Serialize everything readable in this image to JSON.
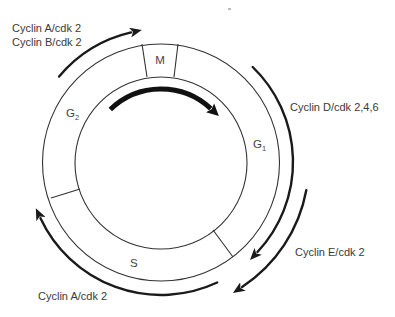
{
  "colors": {
    "background": "#ffffff",
    "ring_line": "#333333",
    "arrow": "#1a1a1a",
    "text": "#3a3a3a"
  },
  "phases": {
    "m": {
      "label": "M"
    },
    "g1": {
      "label": "G",
      "subscript": "1"
    },
    "s": {
      "label": "S"
    },
    "g2": {
      "label": "G",
      "subscript": "2"
    }
  },
  "regulators": {
    "top_left": {
      "lines": [
        "Cyclin A/cdk 2",
        "Cyclin B/cdk 2"
      ]
    },
    "right": {
      "lines": [
        "Cyclin D/cdk 2,4,6"
      ]
    },
    "bottom_right": {
      "lines": [
        "Cyclin E/cdk 2"
      ]
    },
    "bottom_left": {
      "lines": [
        "Cyclin A/cdk 2"
      ]
    }
  }
}
